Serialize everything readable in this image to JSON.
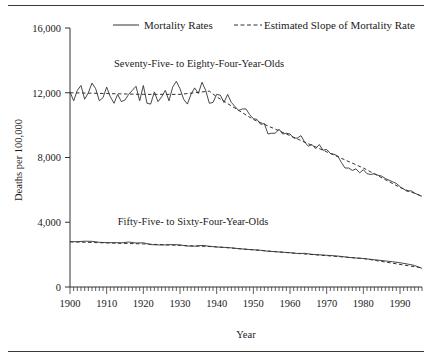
{
  "figure": {
    "top_rule": true,
    "bottom_rule": true
  },
  "chart_data": {
    "type": "line",
    "title": "",
    "xlabel": "Year",
    "ylabel": "Deaths per 100,000",
    "xlim": [
      1900,
      1996
    ],
    "ylim": [
      0,
      16000
    ],
    "grid": false,
    "legend_position": "top",
    "xticks": [
      1900,
      1910,
      1920,
      1930,
      1940,
      1950,
      1960,
      1970,
      1980,
      1990
    ],
    "xtick_labels": [
      "1900",
      "1910",
      "1920",
      "1930",
      "1940",
      "1950",
      "1960",
      "1970",
      "1980",
      "1990"
    ],
    "yticks": [
      0,
      4000,
      8000,
      12000,
      16000
    ],
    "ytick_labels": [
      "0",
      "4,000",
      "8,000",
      "12,000",
      "16,000"
    ],
    "minor_xtick_interval": 1,
    "legend": [
      {
        "label": "Mortality Rates",
        "style": "solid"
      },
      {
        "label": "Estimated Slope of Mortality Rate",
        "style": "dashed"
      }
    ],
    "annotations": [
      {
        "text": "Seventy-Five- to Eighty-Four-Year-Olds",
        "x": 1912,
        "y": 13600
      },
      {
        "text": "Fifty-Five- to Sixty-Four-Year-Olds",
        "x": 1913,
        "y": 3850
      }
    ],
    "series": [
      {
        "name": "Seventy-Five- to Eighty-Four-Year-Olds Mortality Rates",
        "style": "solid",
        "x": [
          1900,
          1901,
          1902,
          1903,
          1904,
          1905,
          1906,
          1907,
          1908,
          1909,
          1910,
          1911,
          1912,
          1913,
          1914,
          1915,
          1916,
          1917,
          1918,
          1919,
          1920,
          1921,
          1922,
          1923,
          1924,
          1925,
          1926,
          1927,
          1928,
          1929,
          1930,
          1931,
          1932,
          1933,
          1934,
          1935,
          1936,
          1937,
          1938,
          1939,
          1940,
          1941,
          1942,
          1943,
          1944,
          1945,
          1946,
          1947,
          1948,
          1949,
          1950,
          1951,
          1952,
          1953,
          1954,
          1955,
          1956,
          1957,
          1958,
          1959,
          1960,
          1961,
          1962,
          1963,
          1964,
          1965,
          1966,
          1967,
          1968,
          1969,
          1970,
          1971,
          1972,
          1973,
          1974,
          1975,
          1976,
          1977,
          1978,
          1979,
          1980,
          1981,
          1982,
          1983,
          1984,
          1985,
          1986,
          1987,
          1988,
          1989,
          1990,
          1991,
          1992,
          1993,
          1994,
          1995,
          1996
        ],
        "y": [
          12050,
          11500,
          12150,
          12450,
          11600,
          12000,
          12600,
          12250,
          11500,
          11700,
          12350,
          11750,
          11350,
          11900,
          11450,
          11550,
          11900,
          12150,
          12400,
          11500,
          12450,
          11350,
          11300,
          12050,
          11450,
          11750,
          12150,
          11500,
          12350,
          12700,
          12250,
          11600,
          11300,
          11900,
          12300,
          11950,
          12650,
          12150,
          11350,
          11400,
          11900,
          11850,
          11400,
          11900,
          11400,
          11150,
          10900,
          11000,
          11000,
          10650,
          10400,
          10350,
          10050,
          10100,
          9450,
          9500,
          9500,
          9750,
          9450,
          9500,
          9450,
          9200,
          9200,
          9350,
          8950,
          8700,
          8800,
          8550,
          8800,
          8450,
          8500,
          8250,
          8200,
          8100,
          7700,
          7350,
          7350,
          7200,
          7300,
          7050,
          7250,
          7000,
          6950,
          7000,
          6900,
          6850,
          6700,
          6600,
          6500,
          6400,
          6200,
          6050,
          5900,
          5950,
          5800,
          5700,
          5600
        ]
      },
      {
        "name": "Seventy-Five- to Eighty-Four-Year-Olds Estimated Slope",
        "style": "dashed",
        "x": [
          1900,
          1910,
          1920,
          1930,
          1938,
          1940,
          1950,
          1960,
          1970,
          1980,
          1990,
          1996
        ],
        "y": [
          12000,
          11950,
          11900,
          11900,
          12100,
          11750,
          10350,
          9350,
          8350,
          7350,
          6150,
          5600
        ]
      },
      {
        "name": "Fifty-Five- to Sixty-Four-Year-Olds Mortality Rates",
        "style": "solid",
        "x": [
          1900,
          1902,
          1904,
          1906,
          1908,
          1910,
          1912,
          1914,
          1916,
          1918,
          1920,
          1922,
          1924,
          1926,
          1928,
          1930,
          1932,
          1934,
          1936,
          1938,
          1940,
          1942,
          1944,
          1946,
          1948,
          1950,
          1952,
          1954,
          1956,
          1958,
          1960,
          1962,
          1964,
          1966,
          1968,
          1970,
          1972,
          1974,
          1976,
          1978,
          1980,
          1982,
          1984,
          1986,
          1988,
          1990,
          1992,
          1994,
          1996
        ],
        "y": [
          2800,
          2800,
          2830,
          2820,
          2760,
          2740,
          2740,
          2730,
          2780,
          2720,
          2730,
          2620,
          2600,
          2600,
          2620,
          2600,
          2530,
          2520,
          2570,
          2520,
          2470,
          2450,
          2420,
          2370,
          2330,
          2300,
          2270,
          2210,
          2180,
          2150,
          2120,
          2070,
          2080,
          2020,
          1990,
          1960,
          1930,
          1890,
          1830,
          1790,
          1760,
          1710,
          1660,
          1610,
          1560,
          1500,
          1420,
          1330,
          1150
        ]
      },
      {
        "name": "Fifty-Five- to Sixty-Four-Year-Olds Estimated Slope",
        "style": "dashed",
        "x": [
          1900,
          1920,
          1940,
          1960,
          1980,
          1996
        ],
        "y": [
          2790,
          2660,
          2480,
          2110,
          1760,
          1180
        ]
      }
    ]
  }
}
